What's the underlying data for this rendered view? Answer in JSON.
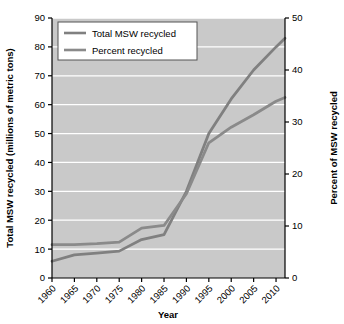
{
  "chart_data": {
    "type": "line",
    "title": "",
    "xlabel": "Year",
    "ylabel": "Total MSW recycled (millions of metric tons)",
    "y2label": "Percent of MSW recycled",
    "xlim": [
      1960,
      2012
    ],
    "ylim": [
      0,
      90
    ],
    "y2lim": [
      0,
      50
    ],
    "grid": true,
    "grid_color": "#ffffff",
    "plot_background": "#c9c9c9",
    "legend_position": "upper left",
    "xticks": [
      "1960",
      "1965",
      "1970",
      "1975",
      "1980",
      "1985",
      "1990",
      "1995",
      "2000",
      "2005",
      "2010"
    ],
    "yticks": [
      "0",
      "10",
      "20",
      "30",
      "40",
      "50",
      "60",
      "70",
      "80",
      "90"
    ],
    "y2ticks": [
      "0",
      "10",
      "20",
      "30",
      "40",
      "50"
    ],
    "x": [
      1960,
      1965,
      1970,
      1975,
      1980,
      1985,
      1990,
      1995,
      2000,
      2005,
      2010,
      2012
    ],
    "series": [
      {
        "name": "Total MSW recycled",
        "axis": "left",
        "color": "#808080",
        "units": "millions of metric tons",
        "values": [
          5.8,
          8.0,
          8.6,
          9.3,
          13.3,
          15.0,
          30.0,
          50.0,
          62.0,
          72.0,
          80.0,
          83.0
        ]
      },
      {
        "name": "Percent recycled",
        "axis": "right",
        "color": "#8a8a8a",
        "units": "percent",
        "values": [
          6.4,
          6.4,
          6.6,
          6.9,
          9.6,
          10.1,
          16.2,
          26.0,
          29.0,
          31.4,
          34.0,
          34.7
        ]
      }
    ]
  },
  "legend": {
    "items": [
      {
        "label": "Total MSW recycled"
      },
      {
        "label": "Percent recycled"
      }
    ]
  },
  "axes": {
    "x_title": "Year",
    "y_left_title": "Total MSW recycled (millions of metric tons)",
    "y_right_title": "Percent of MSW recycled"
  }
}
